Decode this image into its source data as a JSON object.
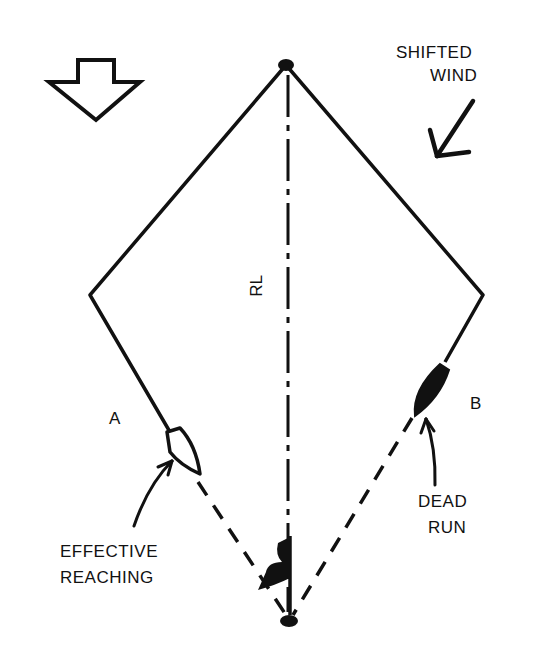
{
  "diagram": {
    "type": "sailing course diagram",
    "colors": {
      "ink": "#111111",
      "background": "#ffffff"
    },
    "labels": {
      "shifted_wind_line1": "SHIFTED",
      "shifted_wind_line2": "WIND",
      "rhumb_line": "RL",
      "boat_a": "A",
      "boat_b": "B",
      "effective_line1": "EFFECTIVE",
      "effective_line2": "REACHING",
      "dead_line1": "DEAD",
      "dead_line2": "RUN"
    },
    "marks": [
      {
        "name": "top-mark",
        "x": 286,
        "y": 65
      },
      {
        "name": "left-corner",
        "x": 90,
        "y": 295
      },
      {
        "name": "right-corner",
        "x": 483,
        "y": 295
      },
      {
        "name": "bottom-mark",
        "x": 289,
        "y": 622
      }
    ],
    "icons": {
      "original_wind": "hollow-down-arrow-icon",
      "shifted_wind": "diagonal-arrow-icon",
      "boat_a": "outlined-boat-icon",
      "boat_b": "filled-boat-icon",
      "finish_flag": "flag-icon"
    }
  }
}
